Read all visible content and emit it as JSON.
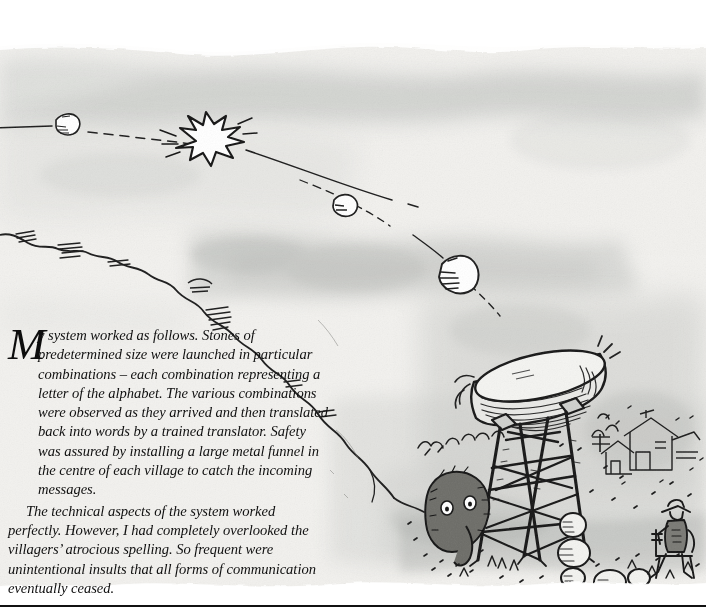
{
  "page": {
    "type": "illustrated-book-page",
    "width": 706,
    "height": 616,
    "background_color": "#ffffff",
    "rule_color": "#111111"
  },
  "illustration": {
    "name": "stone-message-funnel-scene",
    "medium": "pen-and-ink with grey watercolour wash",
    "palette": {
      "ink": "#1a1a1a",
      "wash_light": "#dfe0de",
      "wash_mid": "#c3c5c2",
      "wash_dark": "#a9aba8",
      "paper": "#f6f5f2"
    },
    "elements": [
      {
        "name": "flying-stone-small-left",
        "label": "stone in flight"
      },
      {
        "name": "collision-starburst",
        "label": "stones colliding"
      },
      {
        "name": "flying-stone-mid",
        "label": "stone in flight"
      },
      {
        "name": "flying-stone-large",
        "label": "stone in flight"
      },
      {
        "name": "dashed-trajectory",
        "label": "trajectory of launched stones"
      },
      {
        "name": "ridge-line",
        "label": "hillside ridge"
      },
      {
        "name": "metal-funnel-dish",
        "label": "large metal funnel"
      },
      {
        "name": "timber-tower",
        "label": "wooden support tower"
      },
      {
        "name": "fallen-stones-pile",
        "label": "caught stones"
      },
      {
        "name": "shaggy-creature",
        "label": "creature beside tower"
      },
      {
        "name": "seated-villager",
        "label": "villager seated in chair"
      },
      {
        "name": "village-houses",
        "label": "distant village"
      },
      {
        "name": "scrub-bushes",
        "label": "scrub and grass"
      }
    ]
  },
  "text": {
    "dropcap": "M",
    "paragraphs": [
      "y system worked as follows. Stones of predetermined size were launched in particular combinations – each combination representing a letter of the alphabet. The various combinations were observed as they arrived and then translated back into words by a trained translator. Safety was assured by installing a large metal funnel in the centre of each village to catch the incoming messages.",
      "The technical aspects of the system worked perfectly. However, I had completely overlooked the villagers’ atrocious spelling. So frequent were unintentional insults that all forms of communication eventually ceased."
    ]
  }
}
